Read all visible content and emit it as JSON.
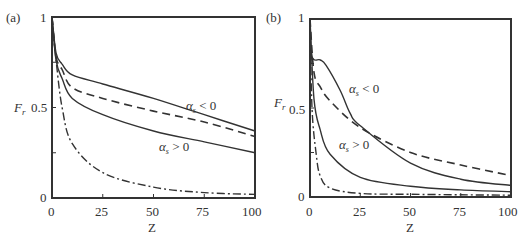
{
  "chart_data": [
    {
      "type": "line",
      "panel_label": "(a)",
      "title": "",
      "xlabel": "Z",
      "ylabel": "F_r",
      "xlim": [
        0,
        100
      ],
      "ylim": [
        0,
        1
      ],
      "x_ticks": [
        "0",
        "25",
        "50",
        "75",
        "100"
      ],
      "y_ticks": [
        "0",
        "0.5",
        "1"
      ],
      "grid": false,
      "annotations": [
        "α_s < 0",
        "α_s > 0"
      ],
      "series": [
        {
          "name": "α_s < 0 (solid, upper)",
          "style": "solid",
          "x": [
            0,
            2,
            5,
            10,
            25,
            50,
            75,
            100
          ],
          "y": [
            1.0,
            0.8,
            0.74,
            0.68,
            0.63,
            0.55,
            0.46,
            0.37
          ]
        },
        {
          "name": "α_s = 0 (dashed)",
          "style": "dashed",
          "x": [
            0,
            2,
            5,
            10,
            25,
            50,
            75,
            100
          ],
          "y": [
            1.0,
            0.78,
            0.71,
            0.61,
            0.55,
            0.48,
            0.42,
            0.34
          ]
        },
        {
          "name": "α_s > 0 (solid, lower)",
          "style": "solid",
          "x": [
            0,
            2,
            5,
            10,
            25,
            50,
            75,
            100
          ],
          "y": [
            1.0,
            0.76,
            0.66,
            0.55,
            0.46,
            0.37,
            0.31,
            0.25
          ]
        },
        {
          "name": "reference (dash-dot)",
          "style": "dashdot",
          "x": [
            0,
            2,
            5,
            10,
            25,
            50,
            75,
            100
          ],
          "y": [
            1.0,
            0.76,
            0.5,
            0.3,
            0.14,
            0.06,
            0.03,
            0.02
          ]
        }
      ]
    },
    {
      "type": "line",
      "panel_label": "(b)",
      "title": "",
      "xlabel": "Z",
      "ylabel": "F_r",
      "xlim": [
        0,
        100
      ],
      "ylim": [
        0,
        1
      ],
      "x_ticks": [
        "0",
        "25",
        "50",
        "75",
        "100"
      ],
      "y_ticks": [
        "0",
        "0.5",
        "1"
      ],
      "grid": false,
      "annotations": [
        "α_s < 0",
        "α_s > 0"
      ],
      "series": [
        {
          "name": "α_s < 0 (solid, upper)",
          "style": "solid",
          "x": [
            0,
            1,
            5,
            8,
            15,
            20,
            25,
            50,
            75,
            100
          ],
          "y": [
            1.0,
            0.79,
            0.77,
            0.74,
            0.6,
            0.47,
            0.4,
            0.19,
            0.1,
            0.065
          ]
        },
        {
          "name": "α_s = 0 (dashed)",
          "style": "dashed",
          "x": [
            0,
            2,
            5,
            10,
            25,
            50,
            75,
            100
          ],
          "y": [
            1.0,
            0.7,
            0.62,
            0.54,
            0.39,
            0.25,
            0.18,
            0.12
          ]
        },
        {
          "name": "α_s > 0 (solid, lower)",
          "style": "solid",
          "x": [
            0,
            2,
            5,
            10,
            25,
            50,
            75,
            100
          ],
          "y": [
            1.0,
            0.55,
            0.38,
            0.24,
            0.11,
            0.06,
            0.04,
            0.03
          ]
        },
        {
          "name": "reference (dash-dot)",
          "style": "dashdot",
          "x": [
            0,
            1,
            3,
            5,
            10,
            25,
            50,
            100
          ],
          "y": [
            1.0,
            0.5,
            0.25,
            0.12,
            0.05,
            0.02,
            0.015,
            0.01
          ]
        }
      ]
    }
  ],
  "labels": {
    "panel_a": "(a)",
    "panel_b": "(b)",
    "x_title": "Z",
    "y_title_main": "F",
    "y_title_sub": "r",
    "anno_neg": "α",
    "anno_neg_sub": "s",
    "anno_neg_rest": " < 0",
    "anno_pos": "α",
    "anno_pos_sub": "s",
    "anno_pos_rest": " > 0",
    "tick_x": [
      "0",
      "25",
      "50",
      "75",
      "100"
    ],
    "tick_y": [
      "0",
      "0.5",
      "1"
    ]
  }
}
